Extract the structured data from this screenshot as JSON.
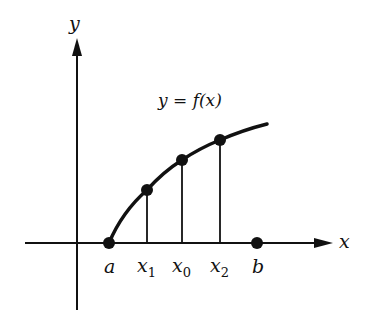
{
  "diagram": {
    "axes": {
      "x_label": "x",
      "y_label": "y"
    },
    "curve_label": "y = f(x)",
    "points": [
      {
        "id": "a",
        "label": "a",
        "subscript": "",
        "on_axis": true
      },
      {
        "id": "x1",
        "label": "x",
        "subscript": "1",
        "on_axis": false
      },
      {
        "id": "x0",
        "label": "x",
        "subscript": "0",
        "on_axis": false
      },
      {
        "id": "x2",
        "label": "x",
        "subscript": "2",
        "on_axis": false
      },
      {
        "id": "b",
        "label": "b",
        "subscript": "",
        "on_axis": true
      }
    ],
    "colors": {
      "ink": "#111111",
      "background": "#ffffff"
    }
  }
}
